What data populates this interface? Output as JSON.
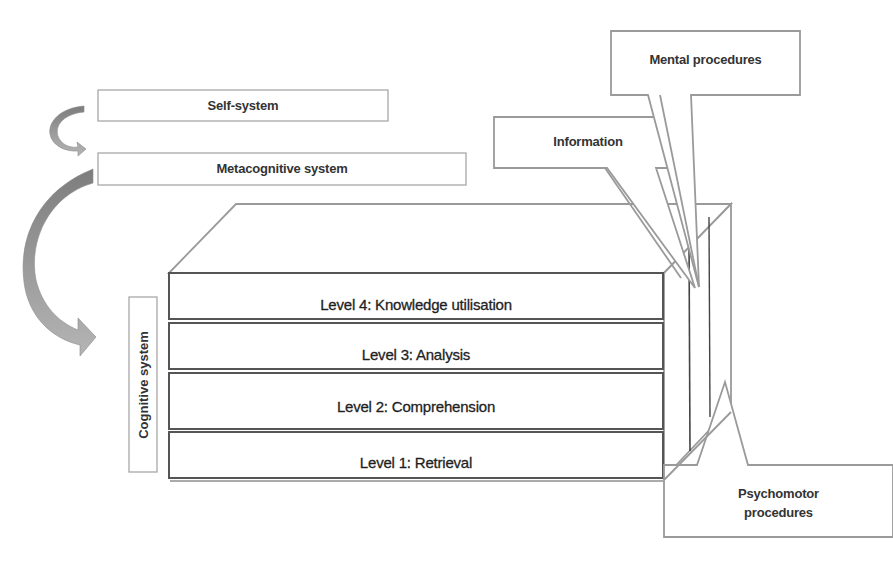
{
  "diagram": {
    "systems": {
      "self": "Self-system",
      "metacognitive": "Metacognitive system",
      "cognitive": "Cognitive system"
    },
    "levels": [
      {
        "id": 4,
        "label": "Level 4: Knowledge utilisation"
      },
      {
        "id": 3,
        "label": "Level 3: Analysis"
      },
      {
        "id": 2,
        "label": "Level 2: Comprehension"
      },
      {
        "id": 1,
        "label": "Level 1: Retrieval"
      }
    ],
    "knowledge_domains": {
      "information": "Information",
      "mental": "Mental procedures",
      "psychomotor_line1": "Psychomotor",
      "psychomotor_line2": "procedures"
    },
    "colors": {
      "box_outline": "#9a9a9a",
      "level_outline": "#555555",
      "arrow_fill": "#8c8c8c",
      "text": "#333333"
    }
  }
}
